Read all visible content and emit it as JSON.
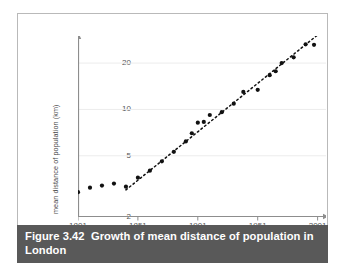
{
  "figure": {
    "caption_number": "Figure 3.42",
    "caption_text": "Growth of mean distance of population in London",
    "caption_full": "Figure 3.42  Growth of mean distance of population in London",
    "frame_color": "#b9b9b9",
    "caption_bg": "#595959",
    "caption_fg": "#ffffff",
    "background": "#ffffff"
  },
  "chart_data": {
    "type": "scatter",
    "title": "Growth of mean distance of population in London",
    "xlabel": "",
    "ylabel": "mean distance of population (km)",
    "x_tick_labels": [
      "1801",
      "1851",
      "1901",
      "1951",
      "2001"
    ],
    "x_ticks": [
      1801,
      1851,
      1901,
      1951,
      2001
    ],
    "y_tick_labels": [
      "2",
      "5",
      "10",
      "20"
    ],
    "y_ticks": [
      2,
      5,
      10,
      20
    ],
    "yscale": "log",
    "xlim": [
      1801,
      2008
    ],
    "ylim": [
      2,
      30
    ],
    "grid": "horizontal-faint",
    "legend": "none",
    "marker_color": "#111111",
    "axis_color": "#8d8d8d",
    "grid_color": "#ececec",
    "trendline": {
      "style": "dashed",
      "color": "#111111",
      "x_start": 1841,
      "y_start": 3.0,
      "x_end": 2001,
      "y_end": 30.5
    },
    "series": [
      {
        "name": "mean distance of population",
        "x": [
          1801,
          1811,
          1821,
          1831,
          1841,
          1851,
          1861,
          1871,
          1881,
          1891,
          1896,
          1901,
          1906,
          1911,
          1921,
          1931,
          1939,
          1951,
          1961,
          1966,
          1971,
          1981,
          1991
        ],
        "y": [
          2.9,
          3.1,
          3.2,
          3.3,
          3.15,
          3.6,
          4.0,
          4.6,
          5.3,
          6.2,
          7.0,
          8.2,
          8.3,
          9.2,
          9.6,
          10.9,
          13.0,
          13.4,
          16.7,
          17.7,
          20.0,
          21.8,
          26.5
        ]
      },
      {
        "name": "outlier-upper-right",
        "x": [
          1998
        ],
        "y": [
          26.3
        ]
      }
    ]
  }
}
